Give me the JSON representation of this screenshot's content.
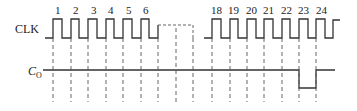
{
  "diagram": {
    "type": "timing",
    "signals": [
      {
        "name": "clk",
        "label": "CLK"
      },
      {
        "name": "co",
        "label_main": "C",
        "label_sub": "O"
      }
    ],
    "pulse_labels_left": [
      "1",
      "2",
      "3",
      "4",
      "5",
      "6"
    ],
    "pulse_labels_right": [
      "18",
      "19",
      "20",
      "21",
      "22",
      "23",
      "24"
    ],
    "co_behavior": "Low pulse from clock 23 rising edge to clock 24 rising edge",
    "colors": {
      "line": "#333333",
      "dashed": "#555555",
      "background": "#ffffff"
    }
  }
}
